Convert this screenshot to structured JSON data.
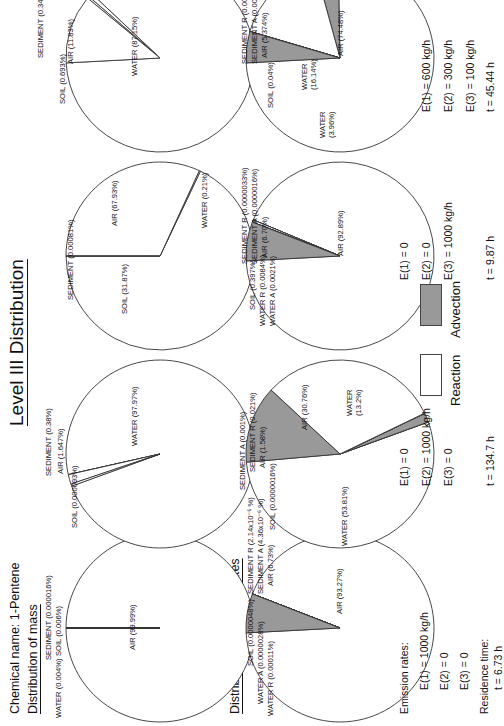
{
  "title": "Level III Distribution",
  "chemical": {
    "label": "Chemical name:",
    "name": "1-Pentene"
  },
  "sections": {
    "mass": "Distribution of mass",
    "removal": "Distribution of removal rates"
  },
  "colors": {
    "reaction": "#ffffff",
    "advection": "#999999",
    "line": "#333333"
  },
  "legend": {
    "reaction": "Reaction",
    "advection": "Advection"
  },
  "emission_label": "Emission rates:",
  "residence_label": "Residence time:",
  "scenarios": [
    {
      "emissions": [
        "E(1) = 1000 kg/h",
        "E(2) = 0",
        "E(3) = 0"
      ],
      "residence": "t  =  6.73 h"
    },
    {
      "emissions": [
        "E(1) = 0",
        "E(2) = 1000 kg/h",
        "E(3) = 0"
      ],
      "residence": "t  =  134.7 h"
    },
    {
      "emissions": [
        "E(1) = 0",
        "E(2) = 0",
        "E(3) = 1000 kg/h"
      ],
      "residence": "t  =  9.87 h"
    },
    {
      "emissions": [
        "E(1) = 600 kg/h",
        "E(2) = 300 kg/h",
        "E(3) = 100 kg/h"
      ],
      "residence": "t  =  45.44 h"
    }
  ],
  "chart_data": [
    {
      "type": "pie",
      "group": "mass",
      "scenario": 1,
      "slices": [
        {
          "name": "AIR",
          "value": 99.99,
          "kind": "reaction"
        },
        {
          "name": "WATER",
          "value": 0.004,
          "kind": "reaction"
        },
        {
          "name": "SOIL",
          "value": 0.006,
          "kind": "reaction"
        },
        {
          "name": "SEDIMENT",
          "value": 1.6e-05,
          "kind": "reaction"
        }
      ],
      "labels": [
        "AIR (99.99%)",
        "WATER (0.004%)",
        "SOIL (0.006%)",
        "SEDIMENT (0.000016%)"
      ]
    },
    {
      "type": "pie",
      "group": "mass",
      "scenario": 2,
      "slices": [
        {
          "name": "WATER",
          "value": 97.97,
          "kind": "reaction"
        },
        {
          "name": "SOIL",
          "value": 9.3e-05,
          "kind": "reaction"
        },
        {
          "name": "AIR",
          "value": 1.647,
          "kind": "reaction"
        },
        {
          "name": "SEDIMENT",
          "value": 0.38,
          "kind": "reaction"
        }
      ],
      "labels": [
        "WATER (97.97%)",
        "SOIL (0.000093%)",
        "AIR (1.647%)",
        "SEDIMENT (0.38%)"
      ]
    },
    {
      "type": "pie",
      "group": "mass",
      "scenario": 3,
      "slices": [
        {
          "name": "AIR",
          "value": 67.93,
          "kind": "reaction"
        },
        {
          "name": "WATER",
          "value": 0.21,
          "kind": "reaction"
        },
        {
          "name": "SOIL",
          "value": 31.87,
          "kind": "reaction"
        },
        {
          "name": "SEDIMENT",
          "value": 0.00081,
          "kind": "reaction"
        }
      ],
      "labels": [
        "AIR (67.93%)",
        "WATER (0.21%)",
        "SOIL (31.87%)",
        "SEDIMENT (0.00081%)"
      ]
    },
    {
      "type": "pie",
      "group": "mass",
      "scenario": 4,
      "slices": [
        {
          "name": "WATER",
          "value": 87.15,
          "kind": "reaction"
        },
        {
          "name": "SOIL",
          "value": 0.693,
          "kind": "reaction"
        },
        {
          "name": "SEDIMENT",
          "value": 0.34,
          "kind": "reaction"
        },
        {
          "name": "AIR",
          "value": 11.83,
          "kind": "reaction"
        }
      ],
      "labels": [
        "WATER (87.15%)",
        "SOIL (0.693%)",
        "SEDIMENT (0.34%)",
        "AIR (11.83%)"
      ]
    },
    {
      "type": "pie",
      "group": "removal",
      "scenario": 1,
      "slices": [
        {
          "name": "AIR R",
          "value": 93.27,
          "kind": "reaction"
        },
        {
          "name": "WATER R",
          "value": 0.00011,
          "kind": "reaction"
        },
        {
          "name": "WATER A",
          "value": 2.8e-06,
          "kind": "advection"
        },
        {
          "name": "SOIL",
          "value": 4.8e-06,
          "kind": "reaction"
        },
        {
          "name": "SEDIMENT R",
          "value": 2.14e-06,
          "kind": "reaction"
        },
        {
          "name": "SEDIMENT A",
          "value": 4.36e-06,
          "kind": "advection"
        },
        {
          "name": "AIR A",
          "value": 6.73,
          "kind": "advection"
        }
      ],
      "labels": [
        "AIR (93.27%)",
        "WATER R (0.00011%)",
        "WATER A (0.0000028%)",
        "SOIL (0.0000048%)",
        "SEDIMENT R (2.14x10⁻⁶ %)",
        "SEDIMENT A (4.36x10⁻⁶ %)",
        "AIR (6.73%)"
      ]
    },
    {
      "type": "pie",
      "group": "removal",
      "scenario": 2,
      "slices": [
        {
          "name": "WATER R",
          "value": 53.81,
          "kind": "reaction"
        },
        {
          "name": "SOIL",
          "value": 1.6e-06,
          "kind": "reaction"
        },
        {
          "name": "AIR A",
          "value": 1.58,
          "kind": "advection"
        },
        {
          "name": "SEDIMENT A",
          "value": 0.001,
          "kind": "advection"
        },
        {
          "name": "SEDIMENT R",
          "value": 0.021,
          "kind": "reaction"
        },
        {
          "name": "AIR R",
          "value": 30.76,
          "kind": "reaction"
        },
        {
          "name": "WATER A",
          "value": 13.2,
          "kind": "advection"
        }
      ],
      "labels": [
        "WATER (53.81%)",
        "SOIL (0.0000016%)",
        "AIR (1.58%)",
        "SEDIMENT A (0.001%)",
        "SEDIMENT R (0.021%)",
        "AIR (30.76%)",
        "WATER (13.2%)"
      ]
    },
    {
      "type": "pie",
      "group": "removal",
      "scenario": 3,
      "slices": [
        {
          "name": "AIR R",
          "value": 92.89,
          "kind": "reaction"
        },
        {
          "name": "WATER A",
          "value": 0.0021,
          "kind": "advection"
        },
        {
          "name": "WATER R",
          "value": 0.0084,
          "kind": "reaction"
        },
        {
          "name": "SOIL",
          "value": 0.397,
          "kind": "reaction"
        },
        {
          "name": "SEDIMENT R",
          "value": 3.3e-06,
          "kind": "reaction"
        },
        {
          "name": "SEDIMENT A",
          "value": 1.6e-06,
          "kind": "advection"
        },
        {
          "name": "AIR A",
          "value": 6.7,
          "kind": "advection"
        }
      ],
      "labels": [
        "AIR (92.89%)",
        "WATER A (0.0021%)",
        "WATER R (0.0084%)",
        "SOIL (0.397%)",
        "SEDIMENT R (0.0000033%)",
        "SEDIMENT A (0.0000016%)",
        "AIR (6.70%)"
      ]
    },
    {
      "type": "pie",
      "group": "removal",
      "scenario": 4,
      "slices": [
        {
          "name": "AIR R",
          "value": 74.48,
          "kind": "reaction"
        },
        {
          "name": "WATER A",
          "value": 3.96,
          "kind": "advection"
        },
        {
          "name": "WATER R",
          "value": 16.14,
          "kind": "reaction"
        },
        {
          "name": "SOIL",
          "value": 0.04,
          "kind": "reaction"
        },
        {
          "name": "SEDIMENT R",
          "value": 0.0063,
          "kind": "reaction"
        },
        {
          "name": "SEDIMENT A",
          "value": 0.00031,
          "kind": "advection"
        },
        {
          "name": "AIR A",
          "value": 5.374,
          "kind": "advection"
        }
      ],
      "labels": [
        "AIR (74.48%)",
        "WATER (3.96%)",
        "WATER (16.14%)",
        "SOIL (0.04%)",
        "SEDIMENT R (0.0063%)",
        "SEDIMENT A (0.00031%)",
        "AIR (5.374%)"
      ]
    }
  ]
}
